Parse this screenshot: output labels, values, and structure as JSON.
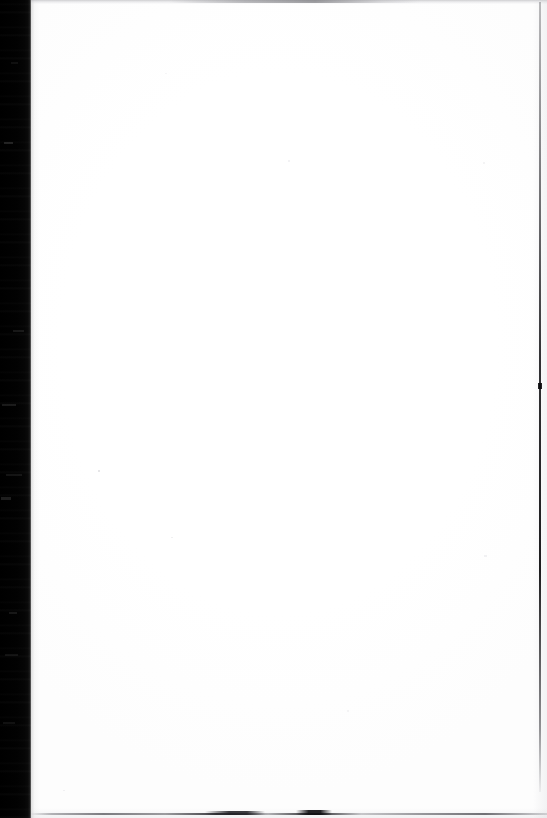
{
  "document": {
    "kind": "scanned-page",
    "page_content_text": "",
    "page_is_blank": true,
    "width_px": 547,
    "height_px": 818
  },
  "page": {
    "surface_color": "#fefefe",
    "background_color": "#ffffff"
  },
  "artifacts": {
    "left_band": {
      "name": "scanner-edge-band",
      "color": "#000000",
      "width_px": 31,
      "position": "left"
    },
    "top_line": {
      "name": "top-edge-line",
      "color": "#a8a8ac",
      "position": "top"
    },
    "right_line": {
      "name": "right-edge-line",
      "color": "#0a0a0c",
      "position": "right"
    },
    "bottom_line": {
      "name": "bottom-edge-line",
      "color": "#14141a",
      "position": "bottom"
    }
  }
}
